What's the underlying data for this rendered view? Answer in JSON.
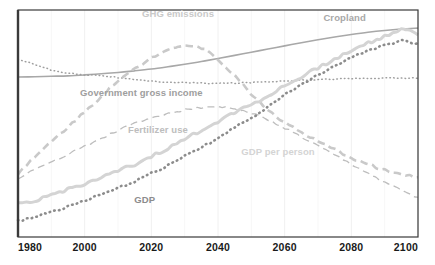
{
  "chart_data": {
    "type": "line",
    "title": "",
    "subtitle": "",
    "xlabel": "",
    "ylabel": "",
    "xlim": [
      1980,
      2100
    ],
    "ylim": [
      0,
      100
    ],
    "grid": "faint vertical gridlines at each 20-year tick; no horizontal gridlines",
    "legend_position": "inline labels placed on the plot next to each curve",
    "xticks": [
      "1980",
      "2000",
      "2020",
      "2040",
      "2060",
      "2080",
      "2100"
    ],
    "yticks": [],
    "x": [
      1980,
      1985,
      1990,
      1995,
      2000,
      2005,
      2010,
      2015,
      2020,
      2025,
      2030,
      2035,
      2040,
      2045,
      2050,
      2055,
      2060,
      2065,
      2070,
      2075,
      2080,
      2085,
      2090,
      2095,
      2100
    ],
    "series": [
      {
        "name": "Cropland",
        "label": "Cropland",
        "style": "solid",
        "color": "#a8a8a8",
        "width": 1.6,
        "label_x": 2078,
        "label_y": 95,
        "values": [
          70.5,
          70.6,
          70.8,
          71.0,
          71.4,
          71.9,
          72.5,
          73.2,
          74.0,
          75.0,
          76.1,
          77.3,
          78.6,
          80.0,
          81.4,
          82.8,
          84.2,
          85.6,
          86.9,
          88.1,
          89.2,
          90.2,
          91.0,
          91.6,
          92.0
        ]
      },
      {
        "name": "Government gross income",
        "label": "Government gross income",
        "style": "dotted",
        "color": "#9e9e9e",
        "width": 1.5,
        "label_x": 2017,
        "label_y": 62,
        "values": [
          78.5,
          76.0,
          73.5,
          72.2,
          71.5,
          71.2,
          70.2,
          69.2,
          68.6,
          68.2,
          68.0,
          67.8,
          67.7,
          67.8,
          68.1,
          68.4,
          68.8,
          69.1,
          69.4,
          69.6,
          69.8,
          69.9,
          70.0,
          70.0,
          70.0
        ]
      },
      {
        "name": "GHG emissions",
        "label": "GHG emissions",
        "style": "dashed-thick",
        "color": "#c9c9c9",
        "width": 2.6,
        "label_x": 2028,
        "label_y": 97,
        "values": [
          28.0,
          35.0,
          42.0,
          48.5,
          55.0,
          62.0,
          68.5,
          74.0,
          79.0,
          83.0,
          84.5,
          83.5,
          78.5,
          71.0,
          63.0,
          56.0,
          50.5,
          46.0,
          42.0,
          38.5,
          35.0,
          32.0,
          29.5,
          27.5,
          26.0
        ]
      },
      {
        "name": "Fertilizer use",
        "label": "Fertilizer use",
        "style": "dashed-thin",
        "color": "#bdbdbd",
        "width": 1.3,
        "label_x": 2022,
        "label_y": 46,
        "values": [
          26.0,
          29.5,
          33.0,
          36.5,
          40.0,
          43.5,
          47.0,
          50.0,
          52.5,
          54.5,
          56.0,
          57.0,
          57.5,
          56.5,
          54.5,
          51.5,
          48.0,
          44.0,
          40.0,
          36.0,
          32.0,
          28.0,
          24.0,
          20.5,
          17.5
        ]
      },
      {
        "name": "GDP per person",
        "label": "GDP per person",
        "style": "solid-thick",
        "color": "#d4d4d4",
        "width": 3.0,
        "label_x": 2058,
        "label_y": 36,
        "values": [
          14.5,
          16.2,
          18.5,
          21.0,
          23.5,
          26.0,
          29.0,
          32.0,
          35.5,
          39.0,
          43.0,
          47.0,
          51.0,
          55.0,
          58.5,
          62.0,
          66.5,
          70.5,
          74.5,
          78.5,
          82.0,
          85.5,
          88.5,
          91.5,
          89.5
        ]
      },
      {
        "name": "GDP",
        "label": "GDP",
        "style": "dotted-thick",
        "color": "#8c8c8c",
        "width": 2.6,
        "label_x": 2018,
        "label_y": 15,
        "values": [
          7.0,
          9.0,
          11.0,
          13.5,
          16.0,
          18.5,
          21.5,
          24.5,
          28.0,
          31.5,
          35.5,
          39.5,
          43.5,
          48.0,
          52.5,
          57.5,
          62.5,
          67.0,
          71.5,
          75.5,
          79.0,
          82.0,
          84.5,
          86.5,
          85.0
        ]
      }
    ]
  },
  "frame": {
    "border_color": "#3a3a3a",
    "gridline_color": "#f0f0f0",
    "background": "#ffffff"
  },
  "axis": {
    "tick_label_color": "#1a1a1a",
    "ticks": [
      {
        "value": 1980,
        "label": "1980"
      },
      {
        "value": 2000,
        "label": "2000"
      },
      {
        "value": 2020,
        "label": "2020"
      },
      {
        "value": 2040,
        "label": "2040"
      },
      {
        "value": 2060,
        "label": "2060"
      },
      {
        "value": 2080,
        "label": "2080"
      },
      {
        "value": 2100,
        "label": "2100"
      }
    ]
  }
}
